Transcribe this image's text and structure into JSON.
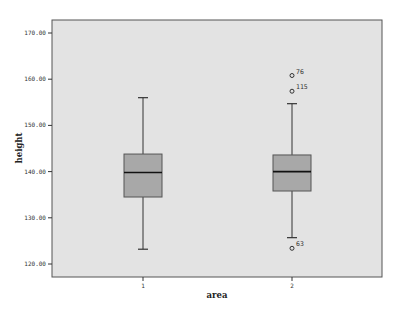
{
  "chart_data": {
    "type": "boxplot",
    "title": "",
    "xlabel": "area",
    "ylabel": "height",
    "ylim": [
      117,
      172.5
    ],
    "yticks": [
      120,
      130,
      140,
      150,
      160,
      170
    ],
    "ytick_labels": [
      "120.00",
      "130.00",
      "140.00",
      "150.00",
      "160.00",
      "170.00"
    ],
    "categories": [
      "1",
      "2"
    ],
    "grid": false,
    "legend": null,
    "boxes": [
      {
        "category": "1",
        "whisker_low": 123.2,
        "q1": 134.5,
        "median": 139.8,
        "q3": 143.8,
        "whisker_high": 156.0,
        "outliers": []
      },
      {
        "category": "2",
        "whisker_low": 125.7,
        "q1": 135.8,
        "median": 140.0,
        "q3": 143.6,
        "whisker_high": 154.7,
        "outliers": [
          {
            "label": "76",
            "value": 160.8
          },
          {
            "label": "115",
            "value": 157.4
          },
          {
            "label": "63",
            "value": 123.4
          }
        ]
      }
    ]
  },
  "colors": {
    "plot_background": "#e3e3e3",
    "box_fill": "#a8a8a8",
    "line": "#333333",
    "frame": "#555555"
  }
}
